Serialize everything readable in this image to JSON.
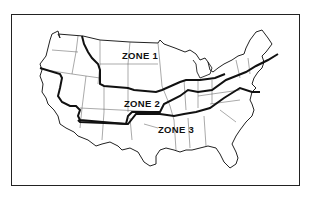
{
  "map": {
    "title": "",
    "region": "Contiguous United States",
    "zones": [
      {
        "id": 1,
        "label": "ZONE 1"
      },
      {
        "id": 2,
        "label": "ZONE 2"
      },
      {
        "id": 3,
        "label": "ZONE 3"
      }
    ],
    "colors": {
      "line": "#222222",
      "background": "#ffffff",
      "text": "#111111"
    }
  }
}
